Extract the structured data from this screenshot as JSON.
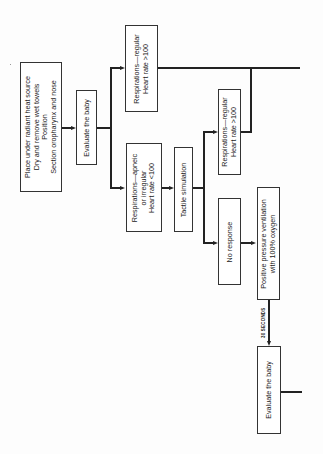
{
  "diagram": {
    "type": "flowchart",
    "orientation": "rotated 90 degrees counter-clockwise",
    "nodes": [
      {
        "id": "prepare",
        "lines": [
          "Place under radiant heat source",
          "Dry and remove wet towels",
          "Position",
          "Section oropharynx and nose"
        ]
      },
      {
        "id": "evaluate1",
        "lines": [
          "Evaluate the baby"
        ]
      },
      {
        "id": "regular1",
        "lines": [
          "Respirations—regular",
          "Heart rate >100"
        ]
      },
      {
        "id": "apneic",
        "lines": [
          "Respirations—apneic",
          "or irregular",
          "Heart rate <100"
        ]
      },
      {
        "id": "tactile",
        "lines": [
          "Tactile simulation"
        ]
      },
      {
        "id": "regular2",
        "lines": [
          "Respirations—regular",
          "Heart rate >100"
        ]
      },
      {
        "id": "noresponse",
        "lines": [
          "No response"
        ]
      },
      {
        "id": "ppv",
        "lines": [
          "Positive pressure ventilation",
          "with 100% oxygen"
        ]
      },
      {
        "id": "evaluate2",
        "lines": [
          "Evaluate the baby"
        ]
      }
    ],
    "edges": [
      {
        "from": "prepare",
        "to": "evaluate1"
      },
      {
        "from": "evaluate1",
        "to": "regular1"
      },
      {
        "from": "evaluate1",
        "to": "apneic"
      },
      {
        "from": "apneic",
        "to": "tactile"
      },
      {
        "from": "tactile",
        "to": "regular2"
      },
      {
        "from": "tactile",
        "to": "noresponse"
      },
      {
        "from": "noresponse",
        "to": "ppv"
      },
      {
        "from": "ppv",
        "to": "evaluate2",
        "label": "30 SECONDS"
      },
      {
        "from": "regular2",
        "to": "regular1-output-line"
      }
    ],
    "edge_label": "30 SECONDS"
  }
}
